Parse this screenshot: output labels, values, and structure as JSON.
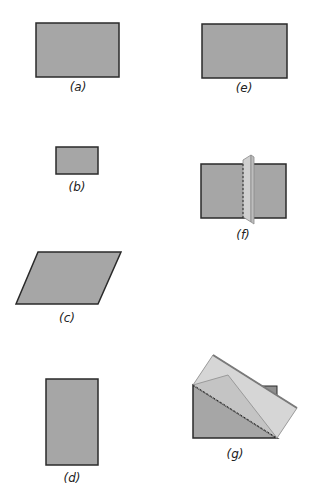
{
  "figures": [
    {
      "id": "a",
      "label": "(a)",
      "shape": "rectangle",
      "description": "medium grey rectangle"
    },
    {
      "id": "b",
      "label": "(b)",
      "shape": "rectangle",
      "description": "small grey rectangle"
    },
    {
      "id": "c",
      "label": "(c)",
      "shape": "parallelogram",
      "description": "grey parallelogram slanted right"
    },
    {
      "id": "d",
      "label": "(d)",
      "shape": "rectangle",
      "description": "tall grey rectangle"
    },
    {
      "id": "e",
      "label": "(e)",
      "shape": "rectangle",
      "description": "grey rectangle"
    },
    {
      "id": "f",
      "label": "(f)",
      "shape": "folded-rectangle",
      "description": "rectangle with a vertical fold panel and dashed crease"
    },
    {
      "id": "g",
      "label": "(g)",
      "shape": "folded-rectangle",
      "description": "rectangle folded diagonally with dashed crease"
    }
  ],
  "colors": {
    "fill": "#a6a6a6",
    "stroke": "#2a2a2a",
    "fold_light": "#d4d4d4",
    "fold_mid": "#c2c2c2",
    "fold_edge": "#8a8a8a"
  }
}
